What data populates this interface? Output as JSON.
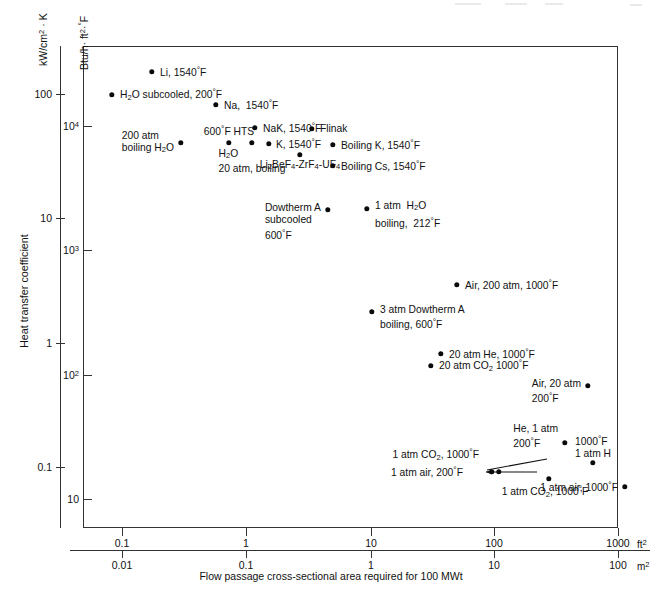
{
  "figure": {
    "title": "",
    "background": "#ffffff",
    "dot_color": "#0a0a0a",
    "axis_color": "#333333"
  },
  "axes": {
    "y_outer": {
      "title": "kW/cm² · K",
      "title_html": "kW/cm<sup>2</sup> · K",
      "ticks": [
        "100",
        "10",
        "1",
        "0.1"
      ],
      "tick_values": [
        100,
        10,
        1,
        0.1
      ]
    },
    "y_inner": {
      "title": "Btu/h · ft² · °F",
      "title_html": "Btu/h · ft<sup>2</sup> · <span class=\"deg\">°</span>F",
      "ticks": [
        "10⁴",
        "10³",
        "10²",
        "10"
      ],
      "tick_values": [
        10000,
        1000,
        100,
        10
      ]
    },
    "y_label": "Heat transfer coefficient",
    "x_upper": {
      "unit": "ft²",
      "unit_html": "ft<sup>2</sup>",
      "ticks": [
        "0.1",
        "1",
        "10",
        "100",
        "1000"
      ],
      "tick_values": [
        0.1,
        1,
        10,
        100,
        1000
      ]
    },
    "x_lower": {
      "unit": "m²",
      "unit_html": "m<sup>2</sup>",
      "ticks": [
        "0.01",
        "0.1",
        "1",
        "10",
        "100"
      ],
      "tick_values": [
        0.01,
        0.1,
        1,
        10,
        100
      ]
    },
    "x_label": "Flow passage cross-sectional area required for 100 MWt"
  },
  "chart_data": {
    "type": "scatter",
    "title": "",
    "xlabel": "Flow passage cross-sectional area required for 100 MWt",
    "ylabel": "Heat transfer coefficient",
    "x_scale": "log",
    "y_scale": "log",
    "x_unit_primary": "ft²",
    "x_unit_secondary": "m²",
    "y_unit_primary": "kW/cm²·K",
    "y_unit_secondary": "Btu/h·ft²·°F",
    "xlim_ft2": [
      0.05,
      2200
    ],
    "ylim_kw": [
      0.028,
      330
    ],
    "grid": false,
    "legend": "none",
    "points": [
      {
        "label": "Li, 1540°F",
        "x_ft2": 0.33,
        "y_kw": 185,
        "label_pos": "right"
      },
      {
        "label": "H₂O subcooled, 200°F",
        "x_ft2": 0.16,
        "y_kw": 98,
        "label_pos": "right"
      },
      {
        "label": "Na,  1540°F",
        "x_ft2": 0.72,
        "y_kw": 62,
        "label_pos": "right"
      },
      {
        "label": "NaK, 1540°F",
        "x_ft2": 2.7,
        "y_kw": 32,
        "label_pos": "right"
      },
      {
        "label": "Flinak",
        "x_ft2": 7.4,
        "y_kw": 30,
        "label_pos": "right"
      },
      {
        "label": "600°F HTS",
        "x_ft2": 1.55,
        "y_kw": 21,
        "label_pos": "above"
      },
      {
        "label": "200 atm\nboiling H₂O",
        "x_ft2": 0.5,
        "y_kw": 21,
        "label_pos": "left"
      },
      {
        "label": "H₂O\n20 atm, boiling",
        "x_ft2": 2.1,
        "y_kw": 21,
        "label_pos": "below"
      },
      {
        "label": "K, 1540°F",
        "x_ft2": 3.5,
        "y_kw": 20,
        "label_pos": "right"
      },
      {
        "label": "Li₂BeF₄-ZrF₄-UF₄",
        "x_ft2": 5.3,
        "y_kw": 15,
        "label_pos": "below"
      },
      {
        "label": "Boiling K, 1540°F",
        "x_ft2": 13.0,
        "y_kw": 20,
        "label_pos": "right"
      },
      {
        "label": "Boiling Cs, 1540°F",
        "x_ft2": 13.0,
        "y_kw": 15,
        "label_pos": "right"
      },
      {
        "label": "Dowtherm A\nsubcooled\n600°F",
        "x_ft2": 2.4,
        "y_kw": 1.35,
        "label_pos": "left"
      },
      {
        "label": "1 atm H₂O\nboiling, 212°F",
        "x_ft2": 4.1,
        "y_kw": 1.4,
        "label_pos": "right"
      },
      {
        "label": "Air, 200 atm, 1000°F",
        "x_ft2": 66.0,
        "y_kw": 0.39,
        "label_pos": "right"
      },
      {
        "label": "3 atm Dowtherm A\nboiling, 600°F",
        "x_ft2": 4.4,
        "y_kw": 0.215,
        "label_pos": "right"
      },
      {
        "label": "20 atm He, 1000°F",
        "x_ft2": 22.0,
        "y_kw": 0.122,
        "label_pos": "right"
      },
      {
        "label": "20 atm CO₂ 1000°F",
        "x_ft2": 17.5,
        "y_kw": 0.103,
        "label_pos": "right"
      },
      {
        "label": "Air, 20 atm\n200°F",
        "x_ft2": 185.0,
        "y_kw": 0.074,
        "label_pos": "left"
      },
      {
        "label": "He, 1 atm\n200°F",
        "x_ft2": 290.0,
        "y_kw": 0.0185,
        "label_pos": "left"
      },
      {
        "label": "1000°F\n1 atm H",
        "x_ft2": 680.0,
        "y_kw": 0.0135,
        "label_pos": "above"
      },
      {
        "label": "1 atm CO₂, 1000°F",
        "x_ft2": 340.0,
        "y_kw": 0.0118,
        "label_pos": "leader"
      },
      {
        "label": "1 atm air, 200°F",
        "x_ft2": 305.0,
        "y_kw": 0.0118,
        "label_pos": "leader"
      },
      {
        "label": "1 atm CO₂, 1000°F",
        "x_ft2": 480.0,
        "y_kw": 0.0105,
        "label_pos": "below"
      },
      {
        "label": "1 atm air, 1000°F",
        "x_ft2": 1180.0,
        "y_kw": 0.0098,
        "label_pos": "left"
      }
    ]
  },
  "points_render": [
    {
      "name": "li-1540f",
      "dot": [
        152,
        72
      ],
      "text": "Li, 1540@F",
      "tx": 160,
      "ty": 72,
      "align": "right",
      "lines": 1
    },
    {
      "name": "h2o-subcooled-200f",
      "dot": [
        112,
        95
      ],
      "text": "H~2~O subcooled, 200@F",
      "tx": 120,
      "ty": 95,
      "align": "right",
      "lines": 1
    },
    {
      "name": "na-1540f",
      "dot": [
        216,
        105
      ],
      "text": "Na,  1540@F",
      "tx": 224,
      "ty": 105,
      "align": "right",
      "lines": 1
    },
    {
      "name": "nak-1540f",
      "dot": [
        255,
        128
      ],
      "text": "NaK, 1540@F",
      "tx": 263,
      "ty": 128,
      "align": "right",
      "lines": 1
    },
    {
      "name": "flinak",
      "dot": [
        312,
        129
      ],
      "text": "Flinak",
      "tx": 320,
      "ty": 129,
      "align": "right",
      "lines": 1
    },
    {
      "name": "hts-600f",
      "dot": [
        229,
        143
      ],
      "text": "600@F HTS",
      "tx": 229,
      "ty": 131,
      "align": "center",
      "lines": 1
    },
    {
      "name": "200atm-boiling-h2o",
      "dot": [
        181,
        143
      ],
      "text": "200 atm\nboiling H~2~O",
      "tx": 174,
      "ty": 143,
      "align": "left",
      "lines": 2
    },
    {
      "name": "h2o-20atm-boiling",
      "dot": [
        252,
        143
      ],
      "text": "H~2~O\n20 atm, boiling",
      "tx": 252,
      "ty": 161,
      "align": "center",
      "lines": 2
    },
    {
      "name": "k-1540f",
      "dot": [
        269,
        144
      ],
      "text": "K, 1540@F",
      "tx": 276,
      "ty": 144,
      "align": "right",
      "lines": 1
    },
    {
      "name": "li2bef4-zrf4-uf4",
      "dot": [
        300,
        155
      ],
      "text": "Li~2~BeF~4~-ZrF~4~-UF~4~",
      "tx": 300,
      "ty": 166,
      "align": "center",
      "lines": 1
    },
    {
      "name": "boiling-k-1540f",
      "dot": [
        333,
        145
      ],
      "text": "Boiling K, 1540@F",
      "tx": 341,
      "ty": 145,
      "align": "right",
      "lines": 1
    },
    {
      "name": "boiling-cs-1540f",
      "dot": [
        333,
        166
      ],
      "text": "Boiling Cs, 1540@F",
      "tx": 341,
      "ty": 166,
      "align": "right",
      "lines": 1
    },
    {
      "name": "dowtherm-a-subcooled",
      "dot": [
        328,
        210
      ],
      "text": "Dowtherm A\nsubcooled\n600@F",
      "tx": 321,
      "ty": 222,
      "align": "left",
      "lines": 3
    },
    {
      "name": "1atm-h2o-boiling",
      "dot": [
        367,
        209
      ],
      "text": "1 atm  H~2~O\nboiling,  212@F",
      "tx": 375,
      "ty": 215,
      "align": "right",
      "lines": 2
    },
    {
      "name": "air-200atm-1000f",
      "dot": [
        457,
        285
      ],
      "text": "Air, 200 atm, 1000@F",
      "tx": 465,
      "ty": 285,
      "align": "right",
      "lines": 1
    },
    {
      "name": "3atm-dowtherm-boil",
      "dot": [
        372,
        312
      ],
      "text": "3 atm Dowtherm A\nboiling, 600@F",
      "tx": 380,
      "ty": 318,
      "align": "right",
      "lines": 2
    },
    {
      "name": "20atm-he-1000f",
      "dot": [
        441,
        354
      ],
      "text": "20 atm He, 1000@F",
      "tx": 449,
      "ty": 354,
      "align": "right",
      "lines": 1
    },
    {
      "name": "20atm-co2-1000f",
      "dot": [
        431,
        366
      ],
      "text": "20 atm CO~2~ 1000@F",
      "tx": 439,
      "ty": 366,
      "align": "right",
      "lines": 1
    },
    {
      "name": "air-20atm-200f",
      "dot": [
        588,
        386
      ],
      "text": "Air, 20 atm\n200@F",
      "tx": 581,
      "ty": 392,
      "align": "left",
      "lines": 2
    },
    {
      "name": "he-1atm-200f",
      "dot": [
        565,
        443
      ],
      "text": "He, 1 atm\n200@F",
      "tx": 558,
      "ty": 437,
      "align": "left",
      "lines": 2
    },
    {
      "name": "1atm-h-1000f",
      "dot": [
        593,
        463
      ],
      "text": "1000@F\n1 atm H",
      "tx": 593,
      "ty": 447,
      "align": "center",
      "lines": 2
    },
    {
      "name": "1atm-co2-1000f-a",
      "dot": [
        499,
        472
      ],
      "text": "1 atm CO~2~, 1000@F",
      "tx": 479,
      "ty": 455,
      "align": "left",
      "lines": 1
    },
    {
      "name": "1atm-air-200f",
      "dot": [
        492,
        472
      ],
      "text": "1 atm air, 200@F",
      "tx": 463,
      "ty": 472,
      "align": "left",
      "lines": 1
    },
    {
      "name": "1atm-co2-1000f-b",
      "dot": [
        549,
        479
      ],
      "text": "1 atm CO~2~, 1000@F",
      "tx": 545,
      "ty": 492,
      "align": "center",
      "lines": 1
    },
    {
      "name": "1atm-air-1000f",
      "dot": [
        625,
        487
      ],
      "text": "1 atm air, 1000@F",
      "tx": 618,
      "ty": 487,
      "align": "left",
      "lines": 1
    }
  ],
  "geometry": {
    "plot": {
      "left": 83,
      "top": 46,
      "width": 535,
      "height": 482
    },
    "y_outer_ticks": [
      {
        "label": "100",
        "y": 94
      },
      {
        "label": "10",
        "y": 218
      },
      {
        "label": "1",
        "y": 343
      },
      {
        "label": "0.1",
        "y": 467
      }
    ],
    "y_inner_ticks": [
      {
        "label": "4",
        "y": 126
      },
      {
        "label": "3",
        "y": 250
      },
      {
        "label": "2",
        "y": 375
      },
      {
        "label": "1",
        "y": 499
      }
    ],
    "x_upper_ticks": [
      {
        "label": "0.1",
        "x": 122
      },
      {
        "label": "1",
        "x": 246
      },
      {
        "label": "10",
        "x": 371
      },
      {
        "label": "100",
        "x": 494
      },
      {
        "label": "1000",
        "x": 618
      }
    ],
    "x_lower_ticks": [
      {
        "label": "0.01",
        "x": 122
      },
      {
        "label": "0.1",
        "x": 246
      },
      {
        "label": "1",
        "x": 371
      },
      {
        "label": "10",
        "x": 494
      },
      {
        "label": "100",
        "x": 618
      }
    ]
  }
}
